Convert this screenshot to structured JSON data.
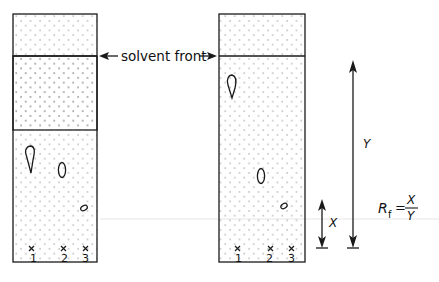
{
  "diagram": {
    "solvent_front_label": "solvent front",
    "plates": [
      {
        "name": "before",
        "spots_origin_labels": [
          "1",
          "2",
          "3"
        ],
        "spots": [
          {
            "lane": "1",
            "shape": "teardrop"
          },
          {
            "lane": "2",
            "shape": "oval"
          },
          {
            "lane": "3",
            "shape": "small-oval"
          }
        ]
      },
      {
        "name": "after",
        "spots_origin_labels": [
          "1",
          "2",
          "3"
        ],
        "spots": [
          {
            "lane": "1",
            "shape": "teardrop"
          },
          {
            "lane": "2",
            "shape": "oval"
          },
          {
            "lane": "3",
            "shape": "small-oval"
          }
        ]
      }
    ],
    "distance_labels": {
      "spot_distance": "X",
      "solvent_distance": "Y"
    },
    "formula": {
      "lhs_main": "R",
      "lhs_sub": "f",
      "equals": "=",
      "numerator": "X",
      "denominator": "Y"
    },
    "colors": {
      "line": "#1a1a1a",
      "dots": "#8a8a8a",
      "guide": "#e6e6e6"
    }
  }
}
